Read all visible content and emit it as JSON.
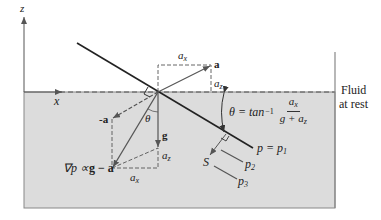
{
  "diagram": {
    "type": "fluid-rigid-body-acceleration",
    "colors": {
      "fluid_fill": "#dcdcdc",
      "line": "#222222",
      "vector": "#555555",
      "background": "#ffffff"
    },
    "axes": {
      "z_label": "z",
      "x_label": "x"
    },
    "labels": {
      "fluid_line1": "Fluid",
      "fluid_line2": "at rest",
      "a_vector": "a",
      "neg_a_vector": "-a",
      "g_vector": "g",
      "theta": "θ",
      "a_x_top": "a",
      "a_x_top_sub": "x",
      "a_z_top": "a",
      "a_z_top_sub": "z",
      "a_z_bottom": "a",
      "a_z_bottom_sub": "z",
      "a_x_bottom": "a",
      "a_x_bottom_sub": "x",
      "grad_p_prefix": "∇p ∝",
      "grad_p_expr": "g − a",
      "s_label": "S",
      "p1_label": "p = p",
      "p1_sub": "1",
      "p2_label": "p",
      "p2_sub": "2",
      "p3_label": "p",
      "p3_sub": "3"
    },
    "formula": {
      "lhs": "θ = tan",
      "exponent": "−1",
      "numerator": "a",
      "numerator_sub": "x",
      "denominator_prefix": "g + a",
      "denominator_sub": "z"
    }
  }
}
